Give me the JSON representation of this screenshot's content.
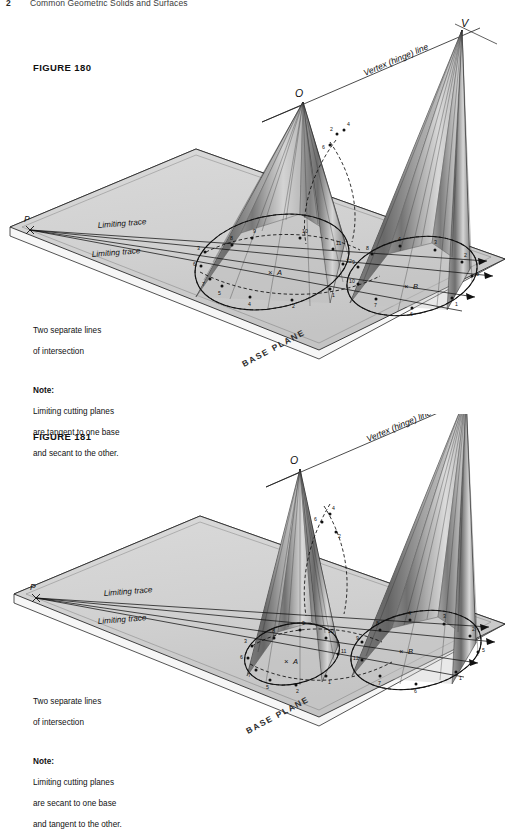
{
  "header": {
    "page_number": "2",
    "title": "Common Geometric Solids and Surfaces"
  },
  "figures": [
    {
      "id": "fig180",
      "label": "FIGURE 180",
      "notes": {
        "line1": "Two separate lines",
        "line2": "of intersection",
        "note_heading": "Note:",
        "note_line1": "Limiting cutting planes",
        "note_line2": "are tangent to one base",
        "note_line3": "and secant to the other."
      },
      "labels": {
        "vertex_v": "V",
        "vertex_o": "O",
        "point_p": "P",
        "hinge_line": "Vertex (hinge) line",
        "limiting_trace_upper": "Limiting trace",
        "limiting_trace_lower": "Limiting trace",
        "base_plane": "BASE PLANE",
        "center_left": "A",
        "center_right": "B",
        "center_mark": "×"
      },
      "point_numbers_left": [
        "1",
        "2",
        "3",
        "4",
        "5",
        "6",
        "7",
        "8",
        "9",
        "10",
        "11",
        "12"
      ],
      "point_numbers_right": [
        "1",
        "2",
        "3",
        "4",
        "5",
        "6",
        "7",
        "8",
        "9",
        "10",
        "11",
        "12"
      ]
    },
    {
      "id": "fig181",
      "label": "FIGURE 181",
      "notes": {
        "line1": "Two separate lines",
        "line2": "of intersection",
        "note_heading": "Note:",
        "note_line1": "Limiting cutting planes",
        "note_line2": "are secant to one base",
        "note_line3": "and tangent to the other."
      },
      "labels": {
        "vertex_v": "V",
        "vertex_o": "O",
        "point_p": "P",
        "hinge_line": "Vertex (hinge) line",
        "limiting_trace_upper": "Limiting trace",
        "limiting_trace_lower": "Limiting trace",
        "base_plane": "BASE PLANE",
        "center_left": "A",
        "center_right": "B",
        "center_mark": "×"
      },
      "point_numbers_left": [
        "1",
        "2",
        "3",
        "4",
        "5",
        "6",
        "7",
        "8",
        "9",
        "10",
        "11",
        "12"
      ],
      "point_numbers_right": [
        "1",
        "2",
        "3",
        "4",
        "5",
        "6",
        "7",
        "8",
        "9",
        "10",
        "11",
        "12"
      ]
    }
  ],
  "colors": {
    "plane_fill": "#d2d2d2",
    "plane_edge": "#2a2a2a",
    "cone_light": "#f2f2f2",
    "cone_dark": "#585858",
    "cone_mid": "#a8a8a8",
    "line": "#1d1d1d",
    "paper": "#ffffff"
  }
}
